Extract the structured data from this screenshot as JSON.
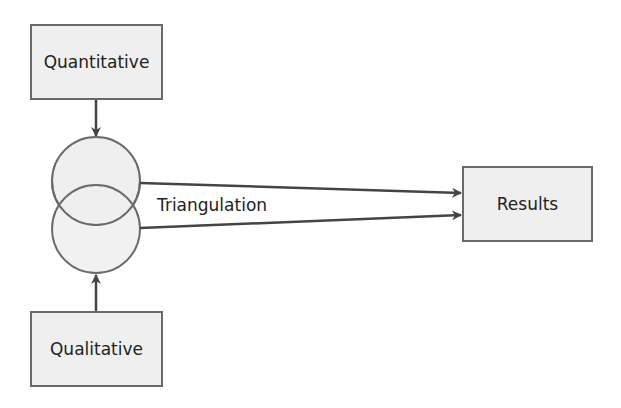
{
  "diagram": {
    "nodes": {
      "quantitative": "Quantitative",
      "qualitative": "Qualitative",
      "results": "Results"
    },
    "edge_label": "Triangulation",
    "colors": {
      "box_fill": "#efefef",
      "stroke": "#6a6a6a",
      "line": "#444444",
      "text": "#222222"
    }
  }
}
